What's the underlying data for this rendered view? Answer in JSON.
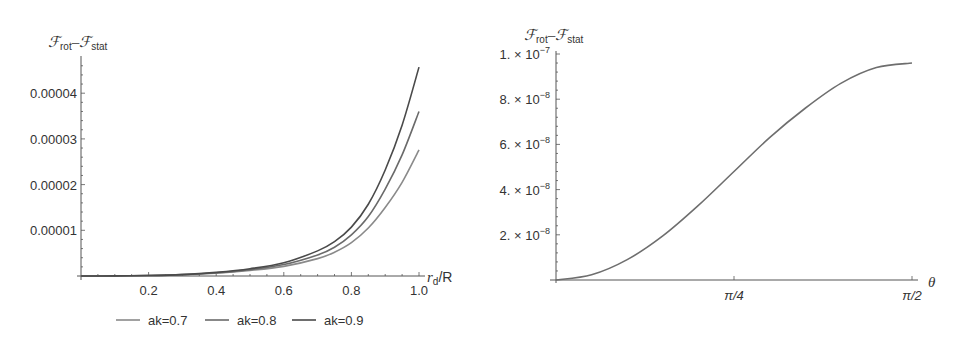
{
  "chart_data": [
    {
      "type": "line",
      "title": "",
      "ylabel": "F_rot - F_stat",
      "ylabel_parts": {
        "main1": "ℱ",
        "sub1": "rot",
        "dash": "–",
        "main2": "ℱ",
        "sub2": "stat"
      },
      "xlabel": "r_d/R",
      "xlabel_parts": {
        "var": "r",
        "sub": "d",
        "rest": "/R"
      },
      "xlim": [
        0,
        1.0
      ],
      "ylim": [
        0,
        4.7e-05
      ],
      "xticks": [
        0.2,
        0.4,
        0.6,
        0.8,
        1.0
      ],
      "xtick_labels": [
        "0.2",
        "0.4",
        "0.6",
        "0.8",
        "1.0"
      ],
      "yticks": [
        1e-05,
        2e-05,
        3e-05,
        4e-05
      ],
      "ytick_labels": [
        "0.00001",
        "0.00002",
        "0.00003",
        "0.00004"
      ],
      "grid": false,
      "legend_position": "bottom",
      "x": [
        0.0,
        0.1,
        0.2,
        0.3,
        0.4,
        0.5,
        0.6,
        0.7,
        0.75,
        0.8,
        0.85,
        0.9,
        0.95,
        1.0
      ],
      "series": [
        {
          "name": "ak=0.7",
          "color": "#8a8a8a",
          "values": [
            0,
            2e-08,
            1e-07,
            3e-07,
            6e-07,
            1.2e-06,
            2.1e-06,
            3.8e-06,
            5.2e-06,
            7.3e-06,
            1.05e-05,
            1.5e-05,
            2.05e-05,
            2.76e-05
          ]
        },
        {
          "name": "ak=0.8",
          "color": "#6a6a6a",
          "values": [
            0,
            2e-08,
            1e-07,
            3e-07,
            7e-07,
            1.4e-06,
            2.5e-06,
            4.6e-06,
            6.3e-06,
            9e-06,
            1.3e-05,
            1.9e-05,
            2.65e-05,
            3.6e-05
          ]
        },
        {
          "name": "ak=0.9",
          "color": "#4a4a4a",
          "values": [
            0,
            2e-08,
            1e-07,
            3e-07,
            8e-07,
            1.6e-06,
            2.9e-06,
            5.5e-06,
            7.5e-06,
            1.07e-05,
            1.57e-05,
            2.32e-05,
            3.3e-05,
            4.57e-05
          ]
        }
      ]
    },
    {
      "type": "line",
      "title": "",
      "ylabel": "F_rot - F_stat",
      "ylabel_parts": {
        "main1": "ℱ",
        "sub1": "rot",
        "dash": "–",
        "main2": "ℱ",
        "sub2": "stat"
      },
      "xlabel": "θ",
      "xlim": [
        0,
        1.5708
      ],
      "ylim": [
        0,
        1e-07
      ],
      "xticks": [
        0.7854,
        1.5708
      ],
      "xtick_labels": [
        "π/4",
        "π/2"
      ],
      "yticks": [
        2e-08,
        4e-08,
        6e-08,
        8e-08,
        1e-07
      ],
      "ytick_labels": [
        {
          "mant": "2.",
          "exp": "−8"
        },
        {
          "mant": "4.",
          "exp": "−8"
        },
        {
          "mant": "6.",
          "exp": "−8"
        },
        {
          "mant": "8.",
          "exp": "−8"
        },
        {
          "mant": "1.",
          "exp": "−7"
        }
      ],
      "ytick_times": "× 10",
      "grid": false,
      "x": [
        0,
        0.1571,
        0.3142,
        0.4712,
        0.6283,
        0.7854,
        0.9425,
        1.0996,
        1.2566,
        1.4137,
        1.5708
      ],
      "series": [
        {
          "name": "curve",
          "color": "#6e6e6e",
          "values": [
            0,
            2.3e-09,
            9e-09,
            1.95e-08,
            3.3e-08,
            4.8e-08,
            6.3e-08,
            7.6e-08,
            8.7e-08,
            9.4e-08,
            9.6e-08
          ]
        }
      ]
    }
  ]
}
